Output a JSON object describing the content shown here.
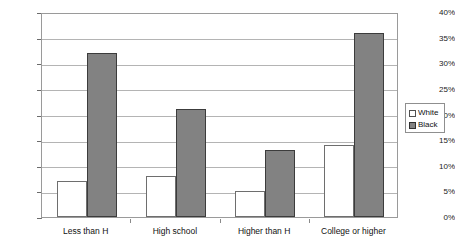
{
  "chart_data": {
    "type": "bar",
    "title": "",
    "subtitle": "",
    "xlabel": "",
    "ylabel": "",
    "categories": [
      "Less than H",
      "High school",
      "Higher than H",
      "College or higher"
    ],
    "series": [
      {
        "name": "White",
        "values": [
          7,
          8,
          5,
          14
        ],
        "swatch": "white"
      },
      {
        "name": "Black",
        "values": [
          32,
          21,
          13,
          36
        ],
        "swatch": "gray"
      }
    ],
    "ylim": [
      0,
      40
    ],
    "ytick_step": 5,
    "ytick_labels": [
      "40%",
      "35%",
      "30%",
      "25%",
      "20%",
      "15%",
      "10%",
      "5%",
      "0%"
    ],
    "ytick_values": [
      40,
      35,
      30,
      25,
      20,
      15,
      10,
      5,
      0
    ],
    "grid": true,
    "legend_position": "right",
    "legend_entries": [
      "White",
      "Black"
    ]
  },
  "colors": {
    "white_bar_fill": "#ffffff",
    "white_bar_border": "#6e6e6e",
    "black_bar_fill": "#828282",
    "black_bar_border": "#3c3c3c",
    "gridline": "#b4b4b4",
    "frame": "#9a9a9a",
    "text": "#111111",
    "background": "#ffffff"
  }
}
